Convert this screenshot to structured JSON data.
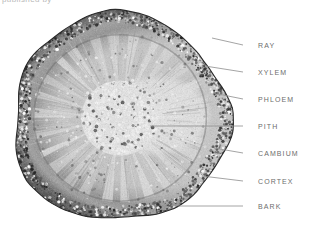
{
  "figure": {
    "type": "botanical-micrograph",
    "clipped_caption": "published  by",
    "specimen": {
      "shape": "rounded-irregular-disc",
      "center_x": 120,
      "center_y": 118,
      "radius_x": 108,
      "radius_y": 104,
      "palette": {
        "background": "#ffffff",
        "bark_dark": "#3c3c3c",
        "cortex_mid": "#8e8e8e",
        "xylem_light": "#cfcfcf",
        "pith_light": "#ededed",
        "outline": "#2e2e2e"
      },
      "zones": [
        {
          "name": "bark",
          "inner_fraction": 0.92,
          "outer_fraction": 1.0,
          "tone": "#4a4a4a"
        },
        {
          "name": "cortex",
          "inner_fraction": 0.82,
          "outer_fraction": 0.92,
          "tone": "#8a8a8a"
        },
        {
          "name": "cambium",
          "inner_fraction": 0.78,
          "outer_fraction": 0.82,
          "tone": "#707070"
        },
        {
          "name": "phloem",
          "inner_fraction": 0.72,
          "outer_fraction": 0.78,
          "tone": "#9a9a9a"
        },
        {
          "name": "xylem",
          "inner_fraction": 0.34,
          "outer_fraction": 0.72,
          "tone": "#c4c4c4"
        },
        {
          "name": "pith",
          "inner_fraction": 0.0,
          "outer_fraction": 0.34,
          "tone": "#e8e8e8"
        }
      ],
      "ray_count": 26
    },
    "labels": [
      {
        "id": "ray",
        "text": "RAY",
        "text_x": 258,
        "text_y": 48,
        "line_x1": 243,
        "line_y1": 45,
        "line_x2": 212,
        "line_y2": 38
      },
      {
        "id": "xylem",
        "text": "XYLEM",
        "text_x": 258,
        "text_y": 75,
        "line_x1": 243,
        "line_y1": 72,
        "line_x2": 205,
        "line_y2": 66
      },
      {
        "id": "phloem",
        "text": "PHLOEM",
        "text_x": 258,
        "text_y": 102,
        "line_x1": 243,
        "line_y1": 99,
        "line_x2": 218,
        "line_y2": 94
      },
      {
        "id": "pith",
        "text": "PITH",
        "text_x": 258,
        "text_y": 129,
        "line_x1": 243,
        "line_y1": 126,
        "line_x2": 150,
        "line_y2": 126
      },
      {
        "id": "cambium",
        "text": "CAMBIUM",
        "text_x": 258,
        "text_y": 156,
        "line_x1": 243,
        "line_y1": 153,
        "line_x2": 214,
        "line_y2": 148
      },
      {
        "id": "cortex",
        "text": "CORTEX",
        "text_x": 258,
        "text_y": 184,
        "line_x1": 243,
        "line_y1": 181,
        "line_x2": 202,
        "line_y2": 176
      },
      {
        "id": "bark",
        "text": "BARK",
        "text_x": 258,
        "text_y": 209,
        "line_x1": 243,
        "line_y1": 206,
        "line_x2": 178,
        "line_y2": 206
      }
    ]
  }
}
